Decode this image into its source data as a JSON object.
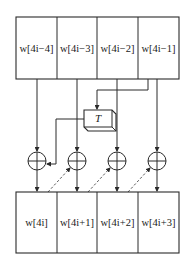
{
  "diagram": {
    "top_row": {
      "cells": [
        {
          "prefix": "w",
          "label": "w[4i−4]"
        },
        {
          "prefix": "w",
          "label": "w[4i−3]"
        },
        {
          "prefix": "w",
          "label": "w[4i−2]"
        },
        {
          "prefix": "w",
          "label": "w[4i−1]"
        }
      ]
    },
    "transform_box": {
      "label": "T"
    },
    "xor_nodes": [
      {
        "symbol": "xor-icon"
      },
      {
        "symbol": "xor-icon"
      },
      {
        "symbol": "xor-icon"
      },
      {
        "symbol": "xor-icon"
      }
    ],
    "bottom_row": {
      "cells": [
        {
          "label": "w[4i]"
        },
        {
          "label": "w[4i+1]"
        },
        {
          "label": "w[4i+2]"
        },
        {
          "label": "w[4i+3]"
        }
      ]
    },
    "colors": {
      "line": "#2a2a2a",
      "background": "#ffffff"
    }
  }
}
